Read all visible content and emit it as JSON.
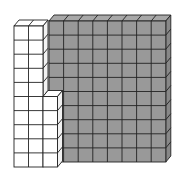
{
  "diagram": {
    "type": "base-ten-blocks",
    "colors": {
      "shaded_fill": "#999999",
      "shaded_side": "#888888",
      "shaded_top": "#a8a8a8",
      "white_fill": "#ffffff",
      "white_side": "#f2f2f2",
      "line": "#222222"
    },
    "blocks": [
      {
        "name": "shaded-block",
        "cols": 8,
        "rows": 10,
        "shaded": true,
        "x": 49,
        "y": 21,
        "cell_w": 14.6,
        "cell_h": 14.1
      },
      {
        "name": "white-tall-block",
        "cols": 2,
        "rows": 10,
        "shaded": false,
        "x": 14,
        "y": 26,
        "cell_w": 14.5,
        "cell_h": 14.1
      },
      {
        "name": "white-short-block",
        "cols": 1,
        "rows": 5,
        "shaded": false,
        "x": 43,
        "y": 96.5,
        "cell_w": 14.5,
        "cell_h": 14.1
      }
    ],
    "depth": {
      "dx": 5,
      "dy": -6
    },
    "caption": ""
  }
}
